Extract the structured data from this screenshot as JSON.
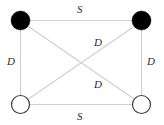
{
  "diagram": {
    "type": "graph",
    "title": "",
    "canvas": {
      "width": 164,
      "height": 125,
      "background": "#ffffff"
    },
    "style": {
      "edge_color": "#cfcfcf",
      "edge_width": 1.1,
      "node_fill_filled": "#000000",
      "node_fill_open": "#ffffff",
      "node_stroke": "#3a3a3a",
      "node_stroke_width": 1.2,
      "node_radius": 9.5,
      "label_color": "#2b2b2b"
    },
    "nodes": [
      {
        "id": "tl",
        "name": "top-left-node",
        "fill": "filled",
        "cx": 20.5,
        "cy": 20.5,
        "r": 9.5
      },
      {
        "id": "tr",
        "name": "top-right-node",
        "fill": "filled",
        "cx": 141.5,
        "cy": 20.5,
        "r": 9.5
      },
      {
        "id": "bl",
        "name": "bottom-left-node",
        "fill": "open",
        "cx": 20.5,
        "cy": 104.5,
        "r": 9.0
      },
      {
        "id": "br",
        "name": "bottom-right-node",
        "fill": "open",
        "cx": 141.5,
        "cy": 104.5,
        "r": 9.0
      }
    ],
    "edges": [
      {
        "id": "top",
        "name": "edge-top",
        "from": "tl",
        "to": "tr",
        "label": "S",
        "x1": 30,
        "y1": 20.5,
        "x2": 132,
        "y2": 20.5
      },
      {
        "id": "left",
        "name": "edge-left",
        "from": "tl",
        "to": "bl",
        "label": "D",
        "x1": 20.5,
        "y1": 30,
        "x2": 20.5,
        "y2": 95.5
      },
      {
        "id": "right",
        "name": "edge-right",
        "from": "tr",
        "to": "br",
        "label": "D",
        "x1": 141.5,
        "y1": 30,
        "x2": 141.5,
        "y2": 95.5
      },
      {
        "id": "diag-tl-br",
        "name": "edge-diagonal-upper",
        "from": "tl",
        "to": "br",
        "label": "D",
        "x1": 28.5,
        "y1": 26.5,
        "x2": 134,
        "y2": 99
      },
      {
        "id": "diag-bl-tr",
        "name": "edge-diagonal-lower",
        "from": "bl",
        "to": "tr",
        "label": "D",
        "x1": 28.5,
        "y1": 99,
        "x2": 134,
        "y2": 26.5
      },
      {
        "id": "bottom",
        "name": "edge-bottom",
        "from": "bl",
        "to": "br",
        "label": "S",
        "x1": 30,
        "y1": 104.5,
        "x2": 132,
        "y2": 104.5
      }
    ],
    "labels": [
      {
        "id": "label-top",
        "name": "edge-label-top",
        "text": "S",
        "x": 77,
        "y": 4
      },
      {
        "id": "label-left",
        "name": "edge-label-left",
        "text": "D",
        "x": 7,
        "y": 56
      },
      {
        "id": "label-right",
        "name": "edge-label-right",
        "text": "D",
        "x": 147,
        "y": 56
      },
      {
        "id": "label-diag-upper",
        "name": "edge-label-diagonal-upper",
        "text": "D",
        "x": 94,
        "y": 37
      },
      {
        "id": "label-diag-lower",
        "name": "edge-label-diagonal-lower",
        "text": "D",
        "x": 94,
        "y": 79
      },
      {
        "id": "label-bottom",
        "name": "edge-label-bottom",
        "text": "S",
        "x": 77,
        "y": 111
      }
    ]
  }
}
